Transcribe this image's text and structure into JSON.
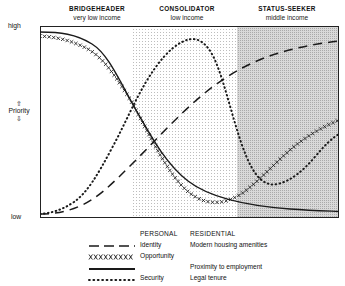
{
  "axis": {
    "high_label": "high",
    "low_label": "low",
    "priority_label": "Priority",
    "arrow_up": "⇧",
    "arrow_down": "⇩"
  },
  "zones": [
    {
      "title": "BRIDGEHEADER",
      "subtitle": "very low income",
      "x_start": 0,
      "x_end": 31,
      "fill": "#ffffff"
    },
    {
      "title": "CONSOLIDATOR",
      "subtitle": "low income",
      "x_start": 31,
      "x_end": 66,
      "fill": "#f0f0f0"
    },
    {
      "title": "STATUS-SEEKER",
      "subtitle": "middle income",
      "x_start": 66,
      "x_end": 100,
      "fill": "#d4d4d4"
    }
  ],
  "legend": {
    "header_personal": "PERSONAL",
    "header_residential": "RESIDENTIAL",
    "rows": [
      {
        "style": "dashed",
        "personal": "Identity",
        "residential": "Modern housing amenities"
      },
      {
        "style": "crosses",
        "personal": "Opportunity",
        "residential": ""
      },
      {
        "style": "solid",
        "personal": "",
        "residential": "Proximity to employment"
      },
      {
        "style": "dotted",
        "personal": "Security",
        "residential": "Legal tenure"
      }
    ]
  },
  "chart_data": {
    "type": "line",
    "title": "",
    "xlabel": "",
    "ylabel": "Priority",
    "xlim": [
      0,
      100
    ],
    "ylim": [
      0,
      100
    ],
    "grid": false,
    "legend_position": "bottom",
    "y_tick_labels": [
      "low",
      "high"
    ],
    "x_band_labels": [
      "BRIDGEHEADER very low income",
      "CONSOLIDATOR low income",
      "STATUS-SEEKER middle income"
    ],
    "series": [
      {
        "name": "Identity",
        "group": "PERSONAL",
        "style": "dashed",
        "color": "#1a1a1a",
        "x": [
          0,
          6,
          12,
          18,
          24,
          30,
          36,
          42,
          48,
          54,
          60,
          66,
          72,
          78,
          84,
          90,
          95,
          100
        ],
        "values": [
          2,
          2,
          3,
          5,
          8,
          12,
          17,
          23,
          30,
          37,
          44,
          51,
          58,
          64,
          69,
          74,
          77,
          79
        ]
      },
      {
        "name": "Opportunity",
        "group": "PERSONAL",
        "style": "crosses",
        "color": "#1a1a1a",
        "x": [
          0,
          6,
          12,
          18,
          24,
          30,
          36,
          42,
          48,
          54,
          58,
          62,
          68,
          74,
          80,
          86,
          92,
          96,
          100
        ],
        "values": [
          95,
          94,
          91,
          86,
          78,
          66,
          52,
          38,
          25,
          14,
          9,
          8,
          11,
          18,
          27,
          37,
          45,
          49,
          52
        ]
      },
      {
        "name": "Proximity to employment",
        "group": "RESIDENTIAL",
        "style": "solid",
        "color": "#1a1a1a",
        "x": [
          0,
          6,
          12,
          18,
          24,
          30,
          36,
          42,
          48,
          54,
          60,
          66,
          72,
          78,
          84,
          90,
          95,
          100
        ],
        "values": [
          97,
          97,
          96,
          93,
          88,
          80,
          70,
          58,
          46,
          35,
          25,
          17,
          12,
          8,
          6,
          5,
          4,
          4
        ]
      },
      {
        "name": "Security / Legal tenure",
        "group": "RESIDENTIAL",
        "style": "dotted",
        "color": "#1a1a1a",
        "x": [
          0,
          5,
          10,
          15,
          20,
          25,
          30,
          35,
          40,
          45,
          48,
          52,
          56,
          60,
          63,
          66,
          70,
          75,
          80,
          86,
          92,
          96,
          100
        ],
        "values": [
          2,
          3,
          5,
          9,
          16,
          28,
          44,
          62,
          78,
          89,
          92,
          91,
          84,
          66,
          42,
          24,
          13,
          10,
          14,
          23,
          33,
          39,
          43
        ]
      }
    ]
  }
}
